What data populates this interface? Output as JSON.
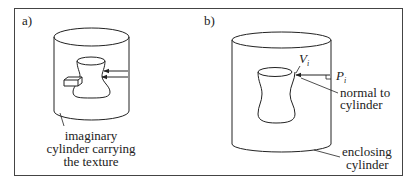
{
  "figure": {
    "panel_a": {
      "label": "a)",
      "annotation_lines": [
        "imaginary",
        "cylinder carrying",
        "the texture"
      ]
    },
    "panel_b": {
      "label": "b)",
      "vertex_label": "V",
      "vertex_subscript": "i",
      "point_label": "P",
      "point_subscript": "i",
      "normal_lines": [
        "normal to",
        "cylinder"
      ],
      "enclosing_lines": [
        "enclosing",
        "cylinder"
      ]
    },
    "colors": {
      "stroke": "#222222",
      "frame": "#444444",
      "background": "#ffffff"
    }
  }
}
